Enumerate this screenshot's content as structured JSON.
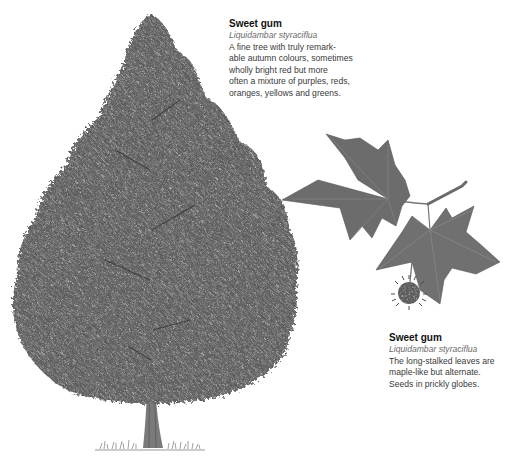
{
  "captions": {
    "tree": {
      "title": "Sweet gum",
      "latin": "Liquidambar styraciflua",
      "lines": [
        "A fine tree with truly remark-",
        "able autumn colours, sometimes",
        "wholly bright red but more",
        "often a mixture of purples, reds,",
        "oranges, yellows and greens."
      ]
    },
    "leaf": {
      "title": "Sweet gum",
      "latin": "Liquidambar styraciflua",
      "lines": [
        "The long-stalked leaves are",
        "maple-like but alternate.",
        "Seeds in prickly globes."
      ]
    }
  },
  "illustrations": {
    "tree": "sweet-gum-tree",
    "leaf": "sweet-gum-leaf-spray-with-seed-globe"
  },
  "colors": {
    "background": "#ffffff",
    "foliage_dark": "#4a4a4a",
    "foliage_mid": "#6e6e6e",
    "foliage_light": "#9a9a9a",
    "leaf": "#6a6a6a",
    "trunk": "#7a7a7a",
    "title_text": "#111111",
    "body_text": "#3a3a3a"
  }
}
